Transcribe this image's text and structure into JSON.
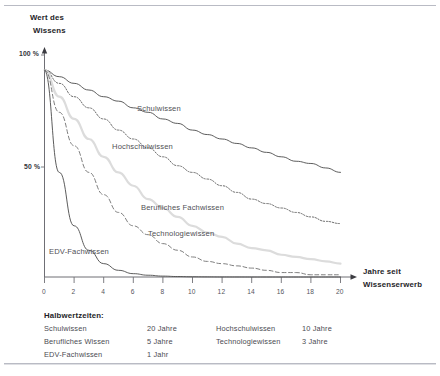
{
  "chart_data": {
    "type": "line",
    "title": "",
    "xlabel": "Jahre seit Wissenserwerb",
    "ylabel": "Wert des Wissens",
    "xlim": [
      0,
      20
    ],
    "ylim": [
      0,
      100
    ],
    "grid": false,
    "legend_position": "inline-annotations",
    "xticks": [
      "0",
      "2",
      "4",
      "6",
      "8",
      "10",
      "12",
      "14",
      "16",
      "18",
      "20"
    ],
    "xtick_values": [
      0,
      2,
      4,
      6,
      8,
      10,
      12,
      14,
      16,
      18,
      20
    ],
    "yticks": [
      "100 %",
      "50 %"
    ],
    "ytick_values": [
      100,
      50
    ],
    "x": [
      0,
      1,
      2,
      3,
      4,
      5,
      6,
      7,
      8,
      9,
      10,
      11,
      12,
      13,
      14,
      15,
      16,
      17,
      18,
      19,
      20
    ],
    "series": [
      {
        "name": "Schulwissen",
        "half_life_years": 20,
        "style": "solid",
        "color": "#4a4a4a",
        "width": 0.9,
        "values": [
          93,
          90,
          87,
          84,
          81,
          79,
          76,
          74,
          71,
          69,
          66,
          64,
          62,
          60,
          58,
          56,
          54,
          52,
          51,
          49,
          47
        ]
      },
      {
        "name": "Hochschulwissen",
        "half_life_years": 10,
        "style": "dotted",
        "color": "#5a5a5a",
        "width": 0.9,
        "values": [
          93,
          87,
          81,
          76,
          71,
          66,
          62,
          58,
          54,
          50,
          47,
          44,
          41,
          38,
          35,
          33,
          31,
          29,
          27,
          25,
          24
        ]
      },
      {
        "name": "Berufliches Fachwissen",
        "half_life_years": 5,
        "style": "solid",
        "color": "#dcdcdc",
        "width": 2.2,
        "values": [
          93,
          81,
          71,
          62,
          54,
          47,
          41,
          35,
          31,
          27,
          23,
          20,
          18,
          15,
          13,
          12,
          10,
          9,
          8,
          7,
          6
        ]
      },
      {
        "name": "Technologiewissen",
        "half_life_years": 3,
        "style": "dashed",
        "color": "#707070",
        "width": 0.9,
        "values": [
          93,
          74,
          59,
          47,
          37,
          29,
          23,
          19,
          15,
          12,
          9,
          7,
          6,
          5,
          4,
          3,
          2,
          2,
          1,
          1,
          1
        ]
      },
      {
        "name": "EDV-Fachwissen",
        "half_life_years": 1,
        "style": "solid",
        "color": "#4a4a4a",
        "width": 0.9,
        "values": [
          93,
          47,
          23,
          12,
          6,
          3,
          1.5,
          0.8,
          0.4,
          0.2,
          0.1,
          0.05,
          0.02,
          0.01,
          0,
          0,
          0,
          0,
          0,
          0,
          0
        ]
      }
    ],
    "annotations": [
      {
        "text": "Schulwissen"
      },
      {
        "text": "Hochschulwissen"
      },
      {
        "text": "Berufliches Fachwissen"
      },
      {
        "text": "Technologiewissen"
      },
      {
        "text": "EDV-Fachwissen"
      }
    ]
  },
  "axes": {
    "y_label_line1": "Wert des",
    "y_label_line2": "Wissens",
    "y_tick_100": "100 %",
    "y_tick_50": "50 %",
    "x_label_line1": "Jahre seit",
    "x_label_line2": "Wissenserwerb",
    "x_tick_0": "0",
    "x_tick_2": "2",
    "x_tick_4": "4",
    "x_tick_6": "6",
    "x_tick_8": "8",
    "x_tick_10": "10",
    "x_tick_12": "12",
    "x_tick_14": "14",
    "x_tick_16": "16",
    "x_tick_18": "18",
    "x_tick_20": "20"
  },
  "curve_labels": {
    "schulwissen": "Schulwissen",
    "hochschulwissen": "Hochschulwissen",
    "berufliches_fachwissen": "Berufliches Fachwissen",
    "technologiewissen": "Technologiewissen",
    "edv_fachwissen": "EDV-Fachwissen"
  },
  "legend": {
    "title": "Halbwertzeiten:",
    "rows_left": [
      {
        "name": "Schulwissen",
        "value": "20 Jahre"
      },
      {
        "name": "Berufliches Wissen",
        "value": "5 Jahre"
      },
      {
        "name": "EDV-Fachwissen",
        "value": "1 Jahr"
      }
    ],
    "rows_right": [
      {
        "name": "Hochschulwissen",
        "value": "10 Jahre"
      },
      {
        "name": "Technologiewissen",
        "value": "3 Jahre"
      }
    ]
  }
}
